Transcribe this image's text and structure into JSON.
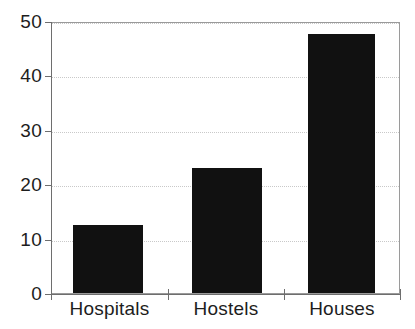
{
  "chart_data": {
    "type": "bar",
    "title": "",
    "subtitle": "",
    "xlabel": "",
    "ylabel": "",
    "categories": [
      "Hospitals",
      "Hostels",
      "Houses"
    ],
    "values": [
      12.5,
      23,
      47.7
    ],
    "series": [
      {
        "name": "",
        "values": [
          12.5,
          23,
          47.7
        ]
      }
    ],
    "ylim": [
      0,
      50
    ],
    "yticks": [
      0,
      10,
      20,
      30,
      40,
      50
    ],
    "ytick_labels": [
      "0",
      "10",
      "20",
      "30",
      "40",
      "50"
    ],
    "grid": "horizontal-dotted",
    "legend": "none",
    "bar_color": "#111111",
    "grid_color": "#c9c9c9",
    "axis_color": "#6e6e6e",
    "text_color": "#1d1d1d",
    "background": "#ffffff"
  },
  "axis": {
    "y": {
      "ticks": [
        {
          "value": 50,
          "label": "50"
        },
        {
          "value": 40,
          "label": "40"
        },
        {
          "value": 30,
          "label": "30"
        },
        {
          "value": 20,
          "label": "20"
        },
        {
          "value": 10,
          "label": "10"
        },
        {
          "value": 0,
          "label": "0"
        }
      ]
    },
    "x": {
      "labels": [
        "Hospitals",
        "Hostels",
        "Houses"
      ]
    }
  }
}
